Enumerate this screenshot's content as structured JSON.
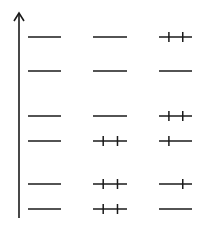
{
  "diagram": {
    "type": "energy-level-diagram",
    "axis": {
      "x": 19,
      "y_top": 13,
      "y_bottom": 218,
      "arrow": "up",
      "color": "#1a1a1a"
    },
    "line_color": "#1a1a1a",
    "columns": [
      {
        "x1": 28,
        "x2": 61
      },
      {
        "x1": 93,
        "x2": 127
      },
      {
        "x1": 159,
        "x2": 192
      }
    ],
    "levels_y": [
      37,
      71,
      116,
      141,
      184,
      209
    ],
    "cells": [
      [
        {
          "ticks": []
        },
        {
          "ticks": []
        },
        {
          "ticks": [
            "left",
            "right"
          ]
        }
      ],
      [
        {
          "ticks": []
        },
        {
          "ticks": []
        },
        {
          "ticks": []
        }
      ],
      [
        {
          "ticks": []
        },
        {
          "ticks": []
        },
        {
          "ticks": [
            "left",
            "right"
          ]
        }
      ],
      [
        {
          "ticks": []
        },
        {
          "ticks": [
            "left",
            "right"
          ]
        },
        {
          "ticks": [
            "left"
          ]
        }
      ],
      [
        {
          "ticks": []
        },
        {
          "ticks": [
            "left",
            "right"
          ]
        },
        {
          "ticks": [
            "right"
          ]
        }
      ],
      [
        {
          "ticks": []
        },
        {
          "ticks": [
            "left",
            "right"
          ]
        },
        {
          "ticks": []
        }
      ]
    ]
  }
}
